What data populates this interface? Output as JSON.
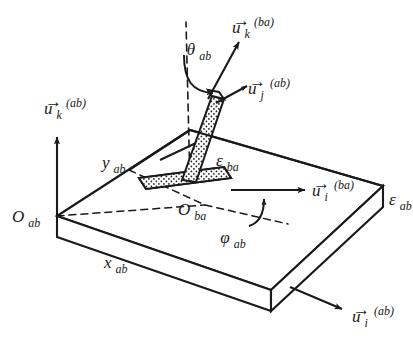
{
  "figure": {
    "name": "two-layer-interface-orientation-diagram",
    "background_color": "#ffffff",
    "stroke_color": "#1a1a1a",
    "stipple_fill": "#f2f2f2",
    "width": 413,
    "height": 343
  },
  "labels": {
    "origin_ab": {
      "base": "O",
      "sub": "ab"
    },
    "origin_ba": {
      "base": "O",
      "sub": "ba"
    },
    "axis_x_ab": {
      "base": "x",
      "sub": "ab"
    },
    "axis_y_ab": {
      "base": "y",
      "sub": "ab"
    },
    "thickness_ab": {
      "base": "ε",
      "sub": "ab"
    },
    "thickness_ba": {
      "base": "ε",
      "sub": "ba"
    },
    "angle_theta_ab": {
      "base": "θ",
      "sub": "ab"
    },
    "angle_phi_ab": {
      "base": "φ",
      "sub": "ab"
    }
  },
  "vectors": {
    "u_k_ab": {
      "arrow": "→",
      "base": "u",
      "sub": "k",
      "sup": "(ab)"
    },
    "u_i_ab": {
      "arrow": "→",
      "base": "u",
      "sub": "i",
      "sup": "(ab)"
    },
    "u_k_ba": {
      "arrow": "→",
      "base": "u",
      "sub": "k",
      "sup": "(ba)"
    },
    "u_i_ba": {
      "arrow": "→",
      "base": "u",
      "sub": "i",
      "sup": "(ba)"
    },
    "u_j_ab": {
      "arrow": "→",
      "base": "u",
      "sub": "j",
      "sup": "(ab)"
    }
  }
}
